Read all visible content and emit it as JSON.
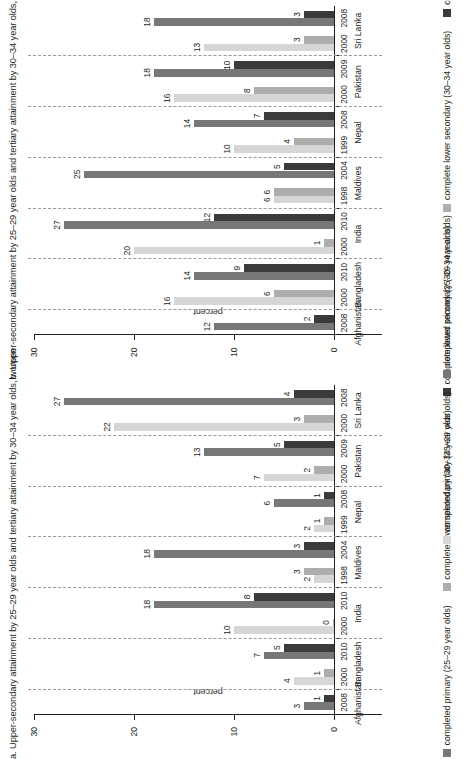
{
  "figure": {
    "axis": {
      "ylabel": "percent",
      "yticks": [
        0,
        10,
        20,
        30
      ],
      "ymin": 0,
      "ymax": 30
    },
    "legend": [
      {
        "label": "completed primary (25–29 year olds)",
        "color": "#d6d6d6"
      },
      {
        "label": "completed primary (25–29 year olds)",
        "color": "#777777"
      },
      {
        "label": "complete lower secondary (30–34 year olds)",
        "color": "#adadad"
      },
      {
        "label": "complete lower secondary (30–34 year olds)",
        "color": "#3b3b3b"
      }
    ]
  },
  "chart_data": [
    {
      "type": "bar",
      "panel": "a",
      "title": "a. Upper-secondary attainment by 25–29 year olds and tertiary attainment by 30–34 year olds, women",
      "xlabel": "",
      "ylabel": "percent",
      "ylim": [
        0,
        30
      ],
      "yticks": [
        0,
        10,
        20,
        30
      ],
      "grid": false,
      "legend_position": "bottom",
      "categories": [
        "Afghanistan 2008",
        "Bangladesh 2000",
        "Bangladesh 2010",
        "India 2000",
        "India 2010",
        "Maldives 1998",
        "Maldives 2004",
        "Nepal 1999",
        "Nepal 2008",
        "Pakistan 2000",
        "Pakistan 2009",
        "Sri Lanka 2000",
        "Sri Lanka 2008"
      ],
      "countries": [
        {
          "name": "Afghanistan",
          "years": [
            "2008"
          ]
        },
        {
          "name": "Bangladesh",
          "years": [
            "2000",
            "2010"
          ]
        },
        {
          "name": "India",
          "years": [
            "2000",
            "2010"
          ]
        },
        {
          "name": "Maldives",
          "years": [
            "1998",
            "2004"
          ]
        },
        {
          "name": "Nepal",
          "years": [
            "1999",
            "2008"
          ]
        },
        {
          "name": "Pakistan",
          "years": [
            "2000",
            "2009"
          ]
        },
        {
          "name": "Sri Lanka",
          "years": [
            "2000",
            "2008"
          ]
        }
      ],
      "series": [
        {
          "name": "completed primary (25–29 year olds)",
          "values": [
            3,
            4,
            7,
            10,
            18,
            2,
            18,
            2,
            6,
            7,
            13,
            22,
            27
          ]
        },
        {
          "name": "complete lower secondary (30–34 year olds)",
          "values": [
            1,
            1,
            5,
            0,
            8,
            3,
            3,
            1,
            1,
            2,
            5,
            3,
            4
          ]
        }
      ],
      "bars": [
        {
          "country": "Afghanistan",
          "year": "2008",
          "recent": true,
          "primary": 3,
          "secondary": 1
        },
        {
          "country": "Bangladesh",
          "year": "2000",
          "recent": false,
          "primary": 4,
          "secondary": 1
        },
        {
          "country": "Bangladesh",
          "year": "2010",
          "recent": true,
          "primary": 7,
          "secondary": 5
        },
        {
          "country": "India",
          "year": "2000",
          "recent": false,
          "primary": 10,
          "secondary": 0
        },
        {
          "country": "India",
          "year": "2010",
          "recent": true,
          "primary": 18,
          "secondary": 8
        },
        {
          "country": "Maldives",
          "year": "1998",
          "recent": false,
          "primary": 2,
          "secondary": 3
        },
        {
          "country": "Maldives",
          "year": "2004",
          "recent": true,
          "primary": 18,
          "secondary": 3
        },
        {
          "country": "Nepal",
          "year": "1999",
          "recent": false,
          "primary": 2,
          "secondary": 1
        },
        {
          "country": "Nepal",
          "year": "2008",
          "recent": true,
          "primary": 6,
          "secondary": 1
        },
        {
          "country": "Pakistan",
          "year": "2000",
          "recent": false,
          "primary": 7,
          "secondary": 2
        },
        {
          "country": "Pakistan",
          "year": "2009",
          "recent": true,
          "primary": 13,
          "secondary": 5
        },
        {
          "country": "Sri Lanka",
          "year": "2000",
          "recent": false,
          "primary": 22,
          "secondary": 3
        },
        {
          "country": "Sri Lanka",
          "year": "2008",
          "recent": true,
          "primary": 27,
          "secondary": 4
        }
      ]
    },
    {
      "type": "bar",
      "panel": "b",
      "title": "b. Upper-secondary attainment by 25–29 year olds and tertiary attainment by 30–34 year olds, men",
      "xlabel": "",
      "ylabel": "percent",
      "ylim": [
        0,
        30
      ],
      "yticks": [
        0,
        10,
        20,
        30
      ],
      "grid": false,
      "legend_position": "bottom",
      "categories": [
        "Afghanistan 2008",
        "Bangladesh 2000",
        "Bangladesh 2010",
        "India 2000",
        "India 2010",
        "Maldives 1998",
        "Maldives 2004",
        "Nepal 1999",
        "Nepal 2008",
        "Pakistan 2000",
        "Pakistan 2009",
        "Sri Lanka 2000",
        "Sri Lanka 2008"
      ],
      "countries": [
        {
          "name": "Afghanistan",
          "years": [
            "2008"
          ]
        },
        {
          "name": "Bangladesh",
          "years": [
            "2000",
            "2010"
          ]
        },
        {
          "name": "India",
          "years": [
            "2000",
            "2010"
          ]
        },
        {
          "name": "Maldives",
          "years": [
            "1998",
            "2004"
          ]
        },
        {
          "name": "Nepal",
          "years": [
            "1999",
            "2008"
          ]
        },
        {
          "name": "Pakistan",
          "years": [
            "2000",
            "2009"
          ]
        },
        {
          "name": "Sri Lanka",
          "years": [
            "2000",
            "2008"
          ]
        }
      ],
      "series": [
        {
          "name": "completed primary (25–29 year olds)",
          "values": [
            12,
            16,
            14,
            20,
            27,
            6,
            25,
            10,
            14,
            16,
            18,
            13,
            18
          ]
        },
        {
          "name": "complete lower secondary (30–34 year olds)",
          "values": [
            2,
            6,
            9,
            1,
            12,
            6,
            5,
            4,
            7,
            8,
            10,
            3,
            3
          ]
        }
      ],
      "bars": [
        {
          "country": "Afghanistan",
          "year": "2008",
          "recent": true,
          "primary": 12,
          "secondary": 2
        },
        {
          "country": "Bangladesh",
          "year": "2000",
          "recent": false,
          "primary": 16,
          "secondary": 6
        },
        {
          "country": "Bangladesh",
          "year": "2010",
          "recent": true,
          "primary": 14,
          "secondary": 9
        },
        {
          "country": "India",
          "year": "2000",
          "recent": false,
          "primary": 20,
          "secondary": 1
        },
        {
          "country": "India",
          "year": "2010",
          "recent": true,
          "primary": 27,
          "secondary": 12
        },
        {
          "country": "Maldives",
          "year": "1998",
          "recent": false,
          "primary": 6,
          "secondary": 6
        },
        {
          "country": "Maldives",
          "year": "2004",
          "recent": true,
          "primary": 25,
          "secondary": 5
        },
        {
          "country": "Nepal",
          "year": "1999",
          "recent": false,
          "primary": 10,
          "secondary": 4
        },
        {
          "country": "Nepal",
          "year": "2008",
          "recent": true,
          "primary": 14,
          "secondary": 7
        },
        {
          "country": "Pakistan",
          "year": "2000",
          "recent": false,
          "primary": 16,
          "secondary": 8
        },
        {
          "country": "Pakistan",
          "year": "2009",
          "recent": true,
          "primary": 18,
          "secondary": 10
        },
        {
          "country": "Sri Lanka",
          "year": "2000",
          "recent": false,
          "primary": 13,
          "secondary": 3
        },
        {
          "country": "Sri Lanka",
          "year": "2008",
          "recent": true,
          "primary": 18,
          "secondary": 3
        }
      ]
    }
  ],
  "colors": {
    "primary_old": "#d6d6d6",
    "secondary_old": "#adadad",
    "primary_recent": "#777777",
    "secondary_recent": "#3b3b3b",
    "axis": "#231f20",
    "separator": "#9a9a9a"
  }
}
